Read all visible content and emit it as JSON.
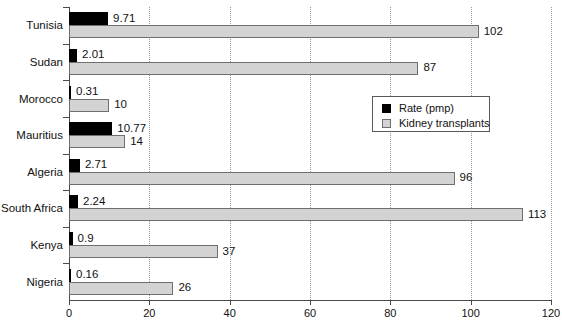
{
  "chart_data": {
    "type": "bar",
    "orientation": "horizontal",
    "title": "",
    "xlabel": "",
    "ylabel": "",
    "xlim": [
      0,
      120
    ],
    "xticks": [
      0,
      20,
      40,
      60,
      80,
      100,
      120
    ],
    "grid": true,
    "legend_position": "upper-right-inside",
    "categories": [
      "Tunisia",
      "Sudan",
      "Morocco",
      "Mauritius",
      "Algeria",
      "South Africa",
      "Kenya",
      "Nigeria"
    ],
    "series": [
      {
        "name": "Rate (pmp)",
        "color": "#000000",
        "values": [
          9.71,
          2.01,
          0.31,
          10.77,
          2.71,
          2.24,
          0.9,
          0.16
        ],
        "labels": [
          "9.71",
          "2.01",
          "0.31",
          "10.77",
          "2.71",
          "2.24",
          "0.9",
          "0.16"
        ]
      },
      {
        "name": "Kidney transplants",
        "color": "#d3d3d3",
        "values": [
          102,
          87,
          10,
          14,
          96,
          113,
          37,
          26
        ],
        "labels": [
          "102",
          "87",
          "10",
          "14",
          "96",
          "113",
          "37",
          "26"
        ]
      }
    ]
  },
  "legend": {
    "items": [
      {
        "label": "Rate (pmp)",
        "swatch": "black-square"
      },
      {
        "label": "Kidney transplants",
        "swatch": "gray-square"
      }
    ]
  },
  "axis": {
    "x_tick_labels": [
      "0",
      "20",
      "40",
      "60",
      "80",
      "100",
      "120"
    ],
    "y_tick_labels": [
      "Tunisia",
      "Sudan",
      "Morocco",
      "Mauritius",
      "Algeria",
      "South Africa",
      "Kenya",
      "Nigeria"
    ]
  }
}
